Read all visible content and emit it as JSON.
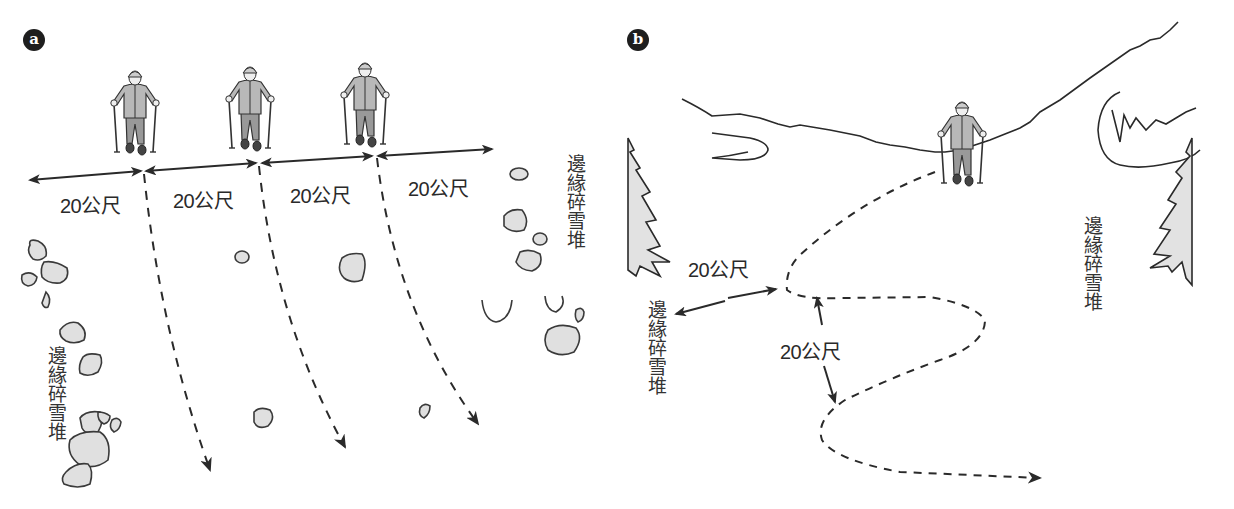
{
  "panels": [
    {
      "id": "a",
      "badge": "a",
      "distance_labels": [
        "20公尺",
        "20公尺",
        "20公尺",
        "20公尺"
      ],
      "side_labels": [
        "邊緣碎雪堆",
        "邊緣碎雪堆"
      ],
      "skier_count": 3,
      "description": "Skiers descending side by side, spaced 20 meters apart, with debris piles at edges"
    },
    {
      "id": "b",
      "badge": "b",
      "distance_labels": [
        "20公尺",
        "20公尺"
      ],
      "side_labels": [
        "邊緣碎雪堆",
        "邊緣碎雪堆"
      ],
      "skier_count": 1,
      "description": "Single skier descending in switchback turns, staying 20 meters from edge debris"
    }
  ],
  "colors": {
    "line": "#2a2a2a",
    "debris_fill": "#e0e0e0",
    "tree_fill": "#e2e2e2",
    "jacket_light": "#b8b8b8",
    "jacket_dark": "#8e8e8e"
  }
}
